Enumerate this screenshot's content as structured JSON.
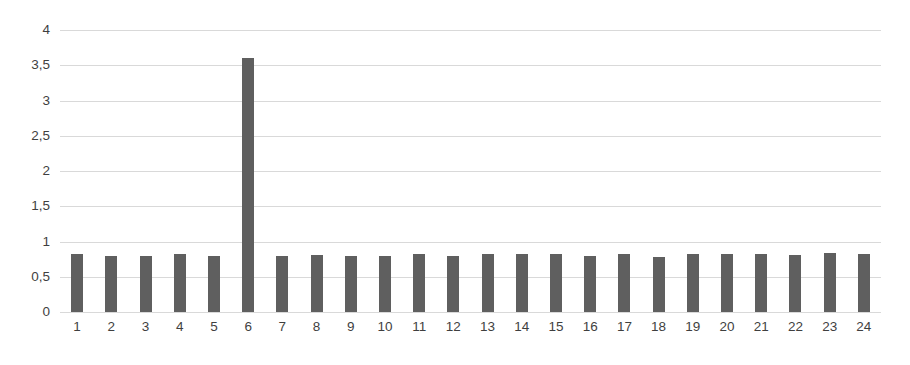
{
  "chart_data": {
    "type": "bar",
    "title": "",
    "subtitle": "",
    "xlabel": "",
    "ylabel": "",
    "categories": [
      "1",
      "2",
      "3",
      "4",
      "5",
      "6",
      "7",
      "8",
      "9",
      "10",
      "11",
      "12",
      "13",
      "14",
      "15",
      "16",
      "17",
      "18",
      "19",
      "20",
      "21",
      "22",
      "23",
      "24"
    ],
    "values": [
      0.82,
      0.79,
      0.79,
      0.82,
      0.79,
      3.6,
      0.79,
      0.81,
      0.79,
      0.79,
      0.82,
      0.79,
      0.82,
      0.82,
      0.83,
      0.79,
      0.82,
      0.78,
      0.82,
      0.82,
      0.82,
      0.81,
      0.84,
      0.82
    ],
    "series": [
      {
        "name": "Series 1",
        "values": [
          0.82,
          0.79,
          0.79,
          0.82,
          0.79,
          3.6,
          0.79,
          0.81,
          0.79,
          0.79,
          0.82,
          0.79,
          0.82,
          0.82,
          0.83,
          0.79,
          0.82,
          0.78,
          0.82,
          0.82,
          0.82,
          0.81,
          0.84,
          0.82
        ],
        "color": "#5f5f5f"
      }
    ],
    "ylim": [
      0,
      4
    ],
    "ytick_values": [
      0,
      0.5,
      1,
      1.5,
      2,
      2.5,
      3,
      3.5,
      4
    ],
    "ytick_labels": [
      "0",
      "0,5",
      "1",
      "1,5",
      "2",
      "2,5",
      "3",
      "3,5",
      "4"
    ],
    "grid": true,
    "grid_axis": "y",
    "legend": false,
    "legend_position": "none",
    "bar_color": "#5f5f5f",
    "grid_color": "#d9d9d9",
    "background_color": "#ffffff",
    "tick_label_color": "#3f3f3f",
    "decimal_separator": ","
  }
}
